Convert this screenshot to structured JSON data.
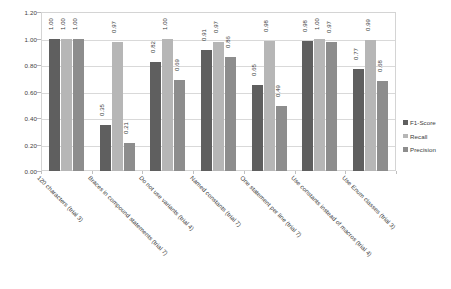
{
  "chart_data": {
    "type": "bar",
    "title": "",
    "xlabel": "",
    "ylabel": "",
    "ylim": [
      0.0,
      1.2
    ],
    "yticks": [
      "0.00",
      "0.20",
      "0.40",
      "0.60",
      "0.80",
      "1.00",
      "1.20"
    ],
    "grid": true,
    "legend_position": "right",
    "categories": [
      "120 characters (trial 3)",
      "Braces in compound statements (trial 7)",
      "Do not use variants (trial 4)",
      "Named constants (trial 7)",
      "One statement per line (trial 7)",
      "Use constants instead of macros (trial 4)",
      "Use Enum classes (trial 3)"
    ],
    "series": [
      {
        "name": "F1-Score",
        "color": "#5f5f5f",
        "values": [
          1.0,
          0.35,
          0.82,
          0.91,
          0.65,
          0.98,
          0.77
        ],
        "labels": [
          "1.00",
          "0.35",
          "0.82",
          "0.91",
          "0.65",
          "0.98",
          "0.77"
        ]
      },
      {
        "name": "Recall",
        "color": "#b6b6b6",
        "values": [
          1.0,
          0.97,
          1.0,
          0.97,
          0.98,
          1.0,
          0.99
        ],
        "labels": [
          "1.00",
          "0.97",
          "1.00",
          "0.97",
          "0.98",
          "1.00",
          "0.99"
        ]
      },
      {
        "name": "Precision",
        "color": "#8d8d8d",
        "values": [
          1.0,
          0.21,
          0.69,
          0.86,
          0.49,
          0.97,
          0.68
        ],
        "labels": [
          "1.00",
          "0.21",
          "0.69",
          "0.86",
          "0.49",
          "0.97",
          "0.68"
        ]
      }
    ]
  },
  "legend": {
    "items": [
      {
        "label": "F1-Score",
        "color": "#5f5f5f"
      },
      {
        "label": "Recall",
        "color": "#b6b6b6"
      },
      {
        "label": "Precision",
        "color": "#8d8d8d"
      }
    ]
  }
}
